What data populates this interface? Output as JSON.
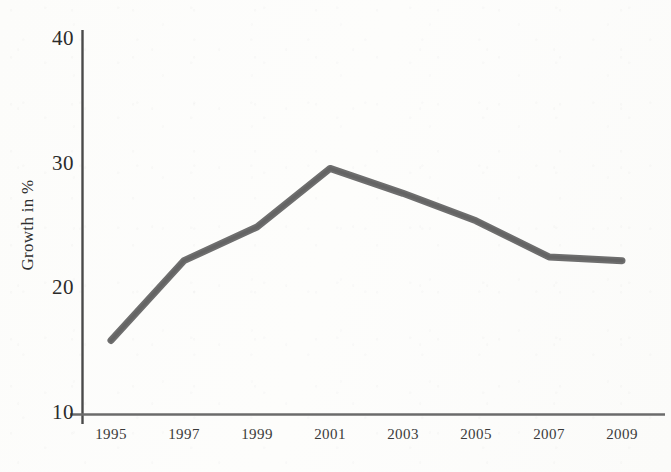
{
  "chart_data": {
    "type": "line",
    "title": "",
    "subtitle": "",
    "xlabel": "",
    "ylabel": "Growth in %",
    "x": [
      1995,
      1997,
      1999,
      2001,
      2003,
      2005,
      2007,
      2009
    ],
    "categories": [
      "1995",
      "1997",
      "1999",
      "2001",
      "2003",
      "2005",
      "2007",
      "2009"
    ],
    "values": [
      15.9,
      22.3,
      25.0,
      29.7,
      27.7,
      25.5,
      22.6,
      22.3
    ],
    "series": [
      {
        "name": "Growth",
        "values": [
          15.9,
          22.3,
          25.0,
          29.7,
          27.7,
          25.5,
          22.6,
          22.3
        ]
      }
    ],
    "xlim": [
      1995,
      2009
    ],
    "ylim": [
      10,
      40
    ],
    "ytick_labels": [
      "40",
      "30",
      "20",
      "10"
    ],
    "ytick_values": [
      40,
      30,
      20,
      10
    ],
    "xtick_labels": [
      "1995",
      "1997",
      "1999",
      "2001",
      "2003",
      "2005",
      "2007",
      "2009"
    ],
    "grid": false,
    "legend": "none",
    "annotations": [],
    "line_color": "#6e6e6e",
    "axis_color": "#4a4a4a",
    "text_color": "#2b2b2b",
    "background_color": "#fdfdfb"
  }
}
